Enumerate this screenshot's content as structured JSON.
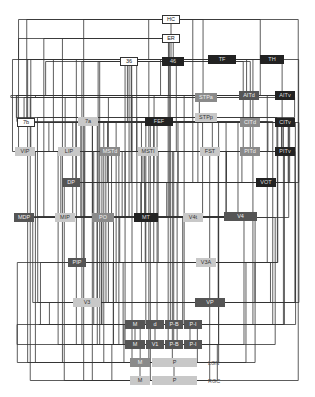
{
  "diagram": {
    "nodes": [
      {
        "id": "HC",
        "label": "HC",
        "x": 162,
        "y": 15,
        "w": 18,
        "tone": "white"
      },
      {
        "id": "ER",
        "label": "ER",
        "x": 162,
        "y": 34,
        "w": 18,
        "tone": "white"
      },
      {
        "id": "36",
        "label": "36",
        "x": 120,
        "y": 57,
        "w": 18,
        "tone": "white"
      },
      {
        "id": "46",
        "label": "46",
        "x": 162,
        "y": 57,
        "w": 22,
        "tone": "black"
      },
      {
        "id": "TF",
        "label": "TF",
        "x": 208,
        "y": 55,
        "w": 28,
        "tone": "black"
      },
      {
        "id": "TH",
        "label": "TH",
        "x": 260,
        "y": 55,
        "w": 24,
        "tone": "black"
      },
      {
        "id": "STPa",
        "label": "STPa",
        "x": 195,
        "y": 93,
        "w": 22,
        "tone": "mid"
      },
      {
        "id": "AITd",
        "label": "AITd",
        "x": 239,
        "y": 91,
        "w": 20,
        "tone": "dark"
      },
      {
        "id": "AITv",
        "label": "AITv",
        "x": 275,
        "y": 91,
        "w": 20,
        "tone": "black"
      },
      {
        "id": "STPp",
        "label": "STPp",
        "x": 195,
        "y": 113,
        "w": 22,
        "tone": "light"
      },
      {
        "id": "CITd",
        "label": "CITd",
        "x": 240,
        "y": 118,
        "w": 20,
        "tone": "mid"
      },
      {
        "id": "CITv",
        "label": "CITv",
        "x": 275,
        "y": 118,
        "w": 20,
        "tone": "black"
      },
      {
        "id": "7b",
        "label": "7b",
        "x": 17,
        "y": 118,
        "w": 18,
        "tone": "white"
      },
      {
        "id": "7a",
        "label": "7a",
        "x": 78,
        "y": 117,
        "w": 20,
        "tone": "light"
      },
      {
        "id": "FEF",
        "label": "FEF",
        "x": 145,
        "y": 117,
        "w": 28,
        "tone": "black"
      },
      {
        "id": "VIP",
        "label": "VIP",
        "x": 15,
        "y": 147,
        "w": 20,
        "tone": "light"
      },
      {
        "id": "LIP",
        "label": "LIP",
        "x": 58,
        "y": 147,
        "w": 22,
        "tone": "light"
      },
      {
        "id": "MSTd",
        "label": "MSTd",
        "x": 100,
        "y": 147,
        "w": 20,
        "tone": "mid"
      },
      {
        "id": "MSTl",
        "label": "MSTl",
        "x": 138,
        "y": 147,
        "w": 20,
        "tone": "light"
      },
      {
        "id": "FST",
        "label": "FST",
        "x": 200,
        "y": 147,
        "w": 20,
        "tone": "light"
      },
      {
        "id": "PITd",
        "label": "PITd",
        "x": 240,
        "y": 147,
        "w": 20,
        "tone": "mid"
      },
      {
        "id": "PITv",
        "label": "PITv",
        "x": 275,
        "y": 147,
        "w": 20,
        "tone": "black"
      },
      {
        "id": "DP",
        "label": "DP",
        "x": 62,
        "y": 178,
        "w": 18,
        "tone": "dark"
      },
      {
        "id": "VOT",
        "label": "VOT",
        "x": 256,
        "y": 178,
        "w": 20,
        "tone": "black"
      },
      {
        "id": "MDP",
        "label": "MDP",
        "x": 14,
        "y": 213,
        "w": 20,
        "tone": "dark"
      },
      {
        "id": "MIP",
        "label": "MIP",
        "x": 55,
        "y": 213,
        "w": 20,
        "tone": "light"
      },
      {
        "id": "PO",
        "label": "PO",
        "x": 92,
        "y": 213,
        "w": 22,
        "tone": "mid"
      },
      {
        "id": "MT",
        "label": "MT",
        "x": 134,
        "y": 213,
        "w": 24,
        "tone": "black"
      },
      {
        "id": "V4t",
        "label": "V4t",
        "x": 183,
        "y": 213,
        "w": 20,
        "tone": "light"
      },
      {
        "id": "V4",
        "label": "V4",
        "x": 224,
        "y": 212,
        "w": 33,
        "tone": "dark"
      },
      {
        "id": "PIP",
        "label": "PIP",
        "x": 68,
        "y": 258,
        "w": 18,
        "tone": "dark"
      },
      {
        "id": "V3A",
        "label": "V3A",
        "x": 196,
        "y": 258,
        "w": 20,
        "tone": "light"
      },
      {
        "id": "V3",
        "label": "V3",
        "x": 73,
        "y": 298,
        "w": 28,
        "tone": "light"
      },
      {
        "id": "VP",
        "label": "VP",
        "x": 195,
        "y": 298,
        "w": 30,
        "tone": "dark"
      },
      {
        "id": "V2_M",
        "label": "M",
        "x": 125,
        "y": 320,
        "w": 20,
        "tone": "dark"
      },
      {
        "id": "V2_d",
        "label": "d",
        "x": 146,
        "y": 320,
        "w": 18,
        "tone": "dark"
      },
      {
        "id": "V2_PB",
        "label": "P-B",
        "x": 165,
        "y": 320,
        "w": 18,
        "tone": "dark"
      },
      {
        "id": "V2_PI",
        "label": "P-I",
        "x": 184,
        "y": 320,
        "w": 18,
        "tone": "dark"
      },
      {
        "id": "V1_M",
        "label": "M",
        "x": 125,
        "y": 340,
        "w": 20,
        "tone": "dark"
      },
      {
        "id": "V1_V1",
        "label": "V1",
        "x": 146,
        "y": 340,
        "w": 18,
        "tone": "dark"
      },
      {
        "id": "V1_PB",
        "label": "P-B",
        "x": 165,
        "y": 340,
        "w": 18,
        "tone": "dark"
      },
      {
        "id": "V1_PI",
        "label": "P-I",
        "x": 184,
        "y": 340,
        "w": 18,
        "tone": "dark"
      },
      {
        "id": "LGN_M",
        "label": "M",
        "x": 130,
        "y": 358,
        "w": 20,
        "tone": "mid"
      },
      {
        "id": "LGN_P",
        "label": "P",
        "x": 152,
        "y": 358,
        "w": 45,
        "tone": "light"
      },
      {
        "id": "RGC_M",
        "label": "M",
        "x": 130,
        "y": 376,
        "w": 20,
        "tone": "light"
      },
      {
        "id": "RGC_P",
        "label": "P",
        "x": 152,
        "y": 376,
        "w": 45,
        "tone": "light"
      }
    ],
    "side_labels": [
      {
        "label": "LGN",
        "x": 208,
        "y": 360
      },
      {
        "label": "RGC",
        "x": 208,
        "y": 378
      }
    ]
  }
}
